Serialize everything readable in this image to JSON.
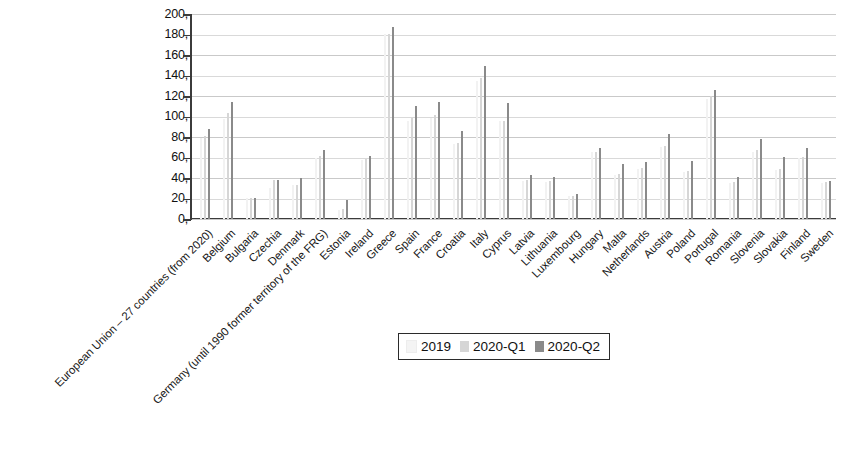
{
  "chart_data": {
    "type": "bar",
    "title": "",
    "subtitle": "",
    "xlabel": "",
    "ylabel": "",
    "ylim": [
      0,
      200
    ],
    "ytick_step": 20,
    "ytick_labels": [
      "200,",
      "180,",
      "160,",
      "140,",
      "120,",
      "100,",
      "80,",
      "60,",
      "40,",
      "20,",
      "0,"
    ],
    "grid": true,
    "legend_position": "bottom-center",
    "decimal_separator": ",",
    "categories": [
      "European Union – 27 countries (from 2020)",
      "Belgium",
      "Bulgaria",
      "Czechia",
      "Denmark",
      "Germany (until 1990 former territory of the FRG)",
      "Estonia",
      "Ireland",
      "Greece",
      "Spain",
      "France",
      "Croatia",
      "Italy",
      "Cyprus",
      "Latvia",
      "Lithuania",
      "Luxembourg",
      "Hungary",
      "Malta",
      "Netherlands",
      "Austria",
      "Poland",
      "Portugal",
      "Romania",
      "Slovenia",
      "Slovakia",
      "Finland",
      "Sweden"
    ],
    "series": [
      {
        "name": "2019",
        "color": "#f2f2f2",
        "values": [
          79.2,
          97.6,
          20.2,
          30.0,
          33.2,
          59.6,
          8.4,
          57.4,
          180.5,
          95.5,
          98.1,
          72.8,
          134.8,
          95.2,
          36.9,
          35.9,
          22.0,
          65.4,
          42.6,
          48.5,
          70.4,
          45.6,
          116.8,
          35.3,
          65.8,
          48.0,
          59.3,
          35.1
        ]
      },
      {
        "name": "2020-Q1",
        "color": "#d6d6d6",
        "values": [
          81.0,
          103.4,
          20.3,
          37.8,
          33.5,
          61.0,
          9.7,
          58.5,
          180.1,
          98.9,
          101.3,
          74.3,
          137.6,
          96.1,
          38.1,
          37.4,
          22.3,
          65.0,
          43.9,
          50.2,
          71.6,
          46.5,
          120.0,
          35.8,
          67.7,
          49.2,
          60.2,
          36.2
        ]
      },
      {
        "name": "2020-Q2",
        "color": "#8a8a8a",
        "values": [
          87.4,
          114.1,
          20.2,
          38.1,
          39.9,
          67.4,
          18.5,
          61.4,
          187.4,
          110.2,
          114.1,
          85.5,
          149.4,
          113.6,
          42.5,
          40.9,
          24.8,
          69.2,
          53.9,
          55.6,
          83.4,
          56.5,
          126.1,
          41.1,
          78.2,
          60.2,
          69.4,
          37.0
        ]
      }
    ]
  },
  "legend": {
    "items": [
      {
        "label": "2019",
        "swatch": "s2019"
      },
      {
        "label": "2020-Q1",
        "swatch": "s2020q1"
      },
      {
        "label": "2020-Q2",
        "swatch": "s2020q2"
      }
    ]
  }
}
